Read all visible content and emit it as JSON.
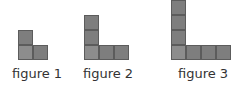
{
  "figures": [
    {
      "label": "figure 1",
      "column_height": 2,
      "row_width": 2,
      "origin_x": 18,
      "label_x": 12
    },
    {
      "label": "figure 2",
      "column_height": 3,
      "row_width": 3,
      "origin_x": 84,
      "label_x": 83
    },
    {
      "label": "figure 3",
      "column_height": 4,
      "row_width": 4,
      "origin_x": 171,
      "label_x": 178
    }
  ],
  "layout": {
    "square_size": 15,
    "baseline_y": 60,
    "label_y": 66
  },
  "colors": {
    "square_fill": "#7e7e7e",
    "corner_fill": "#8d8d8d",
    "square_border": "#5c5c5c",
    "label_text": "#333333"
  }
}
